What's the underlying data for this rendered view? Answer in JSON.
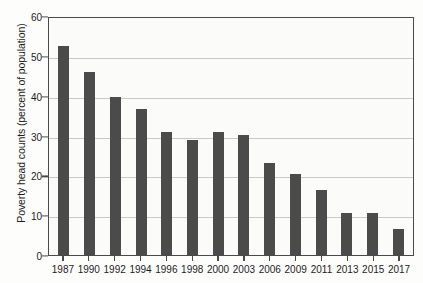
{
  "chart_data": {
    "type": "bar",
    "title": "",
    "xlabel": "",
    "ylabel": "Poverty head counts (percent of population)",
    "categories": [
      "1987",
      "1990",
      "1992",
      "1994",
      "1996",
      "1998",
      "2000",
      "2003",
      "2006",
      "2009",
      "2011",
      "2013",
      "2015",
      "2017"
    ],
    "values": [
      52.8,
      46.3,
      40.0,
      36.8,
      31.1,
      29.2,
      31.1,
      30.4,
      23.4,
      20.7,
      16.6,
      10.7,
      10.7,
      6.9
    ],
    "ylim": [
      0,
      60
    ],
    "y_ticks": [
      0,
      10,
      20,
      30,
      40,
      50,
      60
    ],
    "y_tick_labels": [
      "0",
      "10",
      "20",
      "30",
      "40",
      "50",
      "60"
    ],
    "grid": true,
    "grid_axis": "y",
    "legend": false,
    "legend_position": "none",
    "bar_color": "#4b4b4b",
    "axis_color": "#4a4a4a",
    "grid_color": "#c9c9c6",
    "plot_background": "#fbfbfa"
  }
}
